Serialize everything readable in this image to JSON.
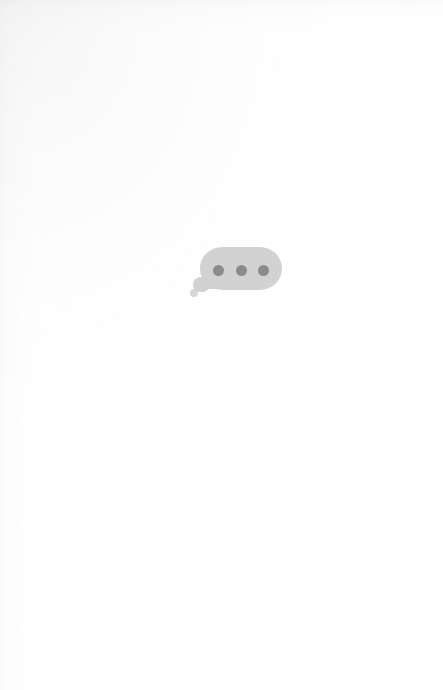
{
  "page": {
    "width": 443,
    "height": 690,
    "background_color": "#ffffff"
  },
  "typing_indicator": {
    "icon_name": "typing-indicator-icon",
    "aria_label": "Typing",
    "bubble_color": "#d2d2d2",
    "dot_color": "#8b8b8b",
    "dot_count": 3,
    "dots": [
      {
        "name": "typing-dot-1"
      },
      {
        "name": "typing-dot-2"
      },
      {
        "name": "typing-dot-3"
      }
    ]
  }
}
